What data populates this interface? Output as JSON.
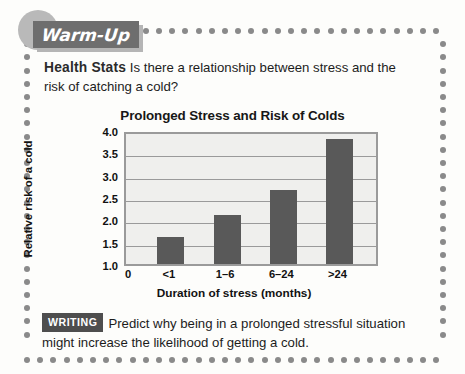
{
  "banner": {
    "label": "Warm-Up"
  },
  "intro": {
    "heading": "Health Stats",
    "text": "Is there a relationship between stress and the risk of catching a cold?"
  },
  "writing": {
    "badge": "WRITING",
    "text": "Predict why being in a prolonged stressful situation might increase the likelihood of getting a cold."
  },
  "colors": {
    "bar": "#595959",
    "plot_background": "#efefed",
    "plot_border": "#9a9a9a",
    "dots": "#8a8a8a",
    "banner_plate": "#6e6e6e",
    "banner_circle": "#b9b9b9",
    "badge": "#4e4e4e"
  },
  "chart_data": {
    "type": "bar",
    "title": "Prolonged Stress and Risk of Colds",
    "xlabel": "Duration of stress (months)",
    "ylabel": "Relative risk of a cold",
    "categories": [
      "<1",
      "1–6",
      "6–24",
      ">24"
    ],
    "values": [
      1.6,
      2.1,
      2.65,
      3.8
    ],
    "x_tick_labels": [
      "0",
      "<1",
      "1–6",
      "6–24",
      ">24"
    ],
    "y_tick_labels": [
      "4.0",
      "3.5",
      "3.0",
      "2.5",
      "2.0",
      "1.5",
      "1.0"
    ],
    "y_tick_values": [
      4.0,
      3.5,
      3.0,
      2.5,
      2.0,
      1.5,
      1.0
    ],
    "ylim": [
      1.0,
      4.0
    ],
    "grid": true,
    "legend": false
  }
}
